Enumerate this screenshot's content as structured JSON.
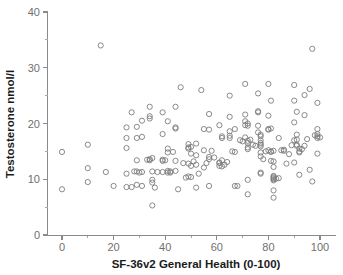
{
  "chart_data": {
    "type": "scatter",
    "title": "",
    "xlabel": "SF-36v2 General Health (0-100)",
    "ylabel": "Testosterone nmol/l",
    "xlim": [
      -6,
      107
    ],
    "ylim": [
      0,
      40
    ],
    "xticks": [
      0,
      20,
      40,
      60,
      80,
      100
    ],
    "xtick_labels": [
      "0",
      "20",
      "40",
      "60",
      "80",
      "100"
    ],
    "xminor_ticks": [
      10,
      30,
      50,
      70,
      90
    ],
    "yticks": [
      0,
      10,
      20,
      30,
      40
    ],
    "ytick_labels": [
      "0",
      "10",
      "20",
      "30",
      "40"
    ],
    "yminor_ticks": [
      5,
      15,
      25,
      35
    ],
    "grid": false,
    "legend": null,
    "marker": {
      "shape": "open-circle",
      "radius": 2.6,
      "stroke": "#7d7d7d",
      "fill": "none"
    },
    "series": [
      {
        "name": "participants",
        "n_points": 201,
        "points": [
          [
            0,
            14.9
          ],
          [
            0,
            8.2
          ],
          [
            10,
            16.2
          ],
          [
            10,
            12.0
          ],
          [
            10,
            9.5
          ],
          [
            15,
            34.0
          ],
          [
            17,
            11.3
          ],
          [
            20,
            8.8
          ],
          [
            25,
            15.6
          ],
          [
            25,
            17.4
          ],
          [
            25,
            19.3
          ],
          [
            25,
            11.0
          ],
          [
            25,
            8.6
          ],
          [
            27,
            22.0
          ],
          [
            27,
            8.6
          ],
          [
            29,
            17.4
          ],
          [
            29,
            19.4
          ],
          [
            29,
            13.4
          ],
          [
            29,
            11.4
          ],
          [
            29,
            9.0
          ],
          [
            31,
            20.5
          ],
          [
            31,
            17.6
          ],
          [
            31,
            11.3
          ],
          [
            31,
            8.8
          ],
          [
            34,
            23.0
          ],
          [
            34,
            21.3
          ],
          [
            34,
            20.9
          ],
          [
            34,
            13.6
          ],
          [
            34,
            13.4
          ],
          [
            35,
            13.8
          ],
          [
            35,
            11.4
          ],
          [
            35,
            9.9
          ],
          [
            35,
            9.4
          ],
          [
            35,
            5.3
          ],
          [
            36,
            8.5
          ],
          [
            39,
            22.0
          ],
          [
            39,
            18.1
          ],
          [
            39,
            13.5
          ],
          [
            39,
            13.3
          ],
          [
            39,
            11.3
          ],
          [
            41,
            20.4
          ],
          [
            41,
            15.5
          ],
          [
            41,
            14.8
          ],
          [
            41,
            11.5
          ],
          [
            41,
            11.2
          ],
          [
            42,
            11.4
          ],
          [
            42,
            11.2
          ],
          [
            44,
            23.0
          ],
          [
            44,
            19.3
          ],
          [
            44,
            19.1
          ],
          [
            44,
            13.3
          ],
          [
            44,
            11.5
          ],
          [
            45,
            8.2
          ],
          [
            46,
            26.5
          ],
          [
            49,
            16.3
          ],
          [
            49,
            15.7
          ],
          [
            49,
            15.5
          ],
          [
            49,
            12.8
          ],
          [
            49,
            10.5
          ],
          [
            50,
            15.8
          ],
          [
            50,
            14.6
          ],
          [
            50,
            12.4
          ],
          [
            50,
            10.4
          ],
          [
            52,
            16.4
          ],
          [
            52,
            14.3
          ],
          [
            52,
            12.6
          ],
          [
            52,
            8.5
          ],
          [
            54,
            26.0
          ],
          [
            55,
            19.0
          ],
          [
            55,
            15.2
          ],
          [
            55,
            12.1
          ],
          [
            57,
            21.7
          ],
          [
            57,
            18.9
          ],
          [
            57,
            14.0
          ],
          [
            57,
            13.6
          ],
          [
            57,
            8.8
          ],
          [
            61,
            19.7
          ],
          [
            61,
            13.0
          ],
          [
            61,
            12.9
          ],
          [
            61,
            12.4
          ],
          [
            62,
            17.7
          ],
          [
            62,
            17.4
          ],
          [
            62,
            13.4
          ],
          [
            62,
            12.3
          ],
          [
            65,
            25.0
          ],
          [
            65,
            21.2
          ],
          [
            65,
            18.6
          ],
          [
            65,
            17.8
          ],
          [
            65,
            17.4
          ],
          [
            67,
            19.0
          ],
          [
            67,
            14.9
          ],
          [
            67,
            8.8
          ],
          [
            71,
            27.1
          ],
          [
            71,
            21.6
          ],
          [
            71,
            20.4
          ],
          [
            71,
            19.7
          ],
          [
            71,
            17.5
          ],
          [
            72,
            20.0
          ],
          [
            72,
            19.6
          ],
          [
            72,
            16.9
          ],
          [
            72,
            16.5
          ],
          [
            72,
            15.7
          ],
          [
            72,
            15.4
          ],
          [
            72,
            9.9
          ],
          [
            72,
            7.3
          ],
          [
            76,
            25.4
          ],
          [
            76,
            22.2
          ],
          [
            76,
            22.0
          ],
          [
            76,
            19.6
          ],
          [
            76,
            18.4
          ],
          [
            77,
            18.0
          ],
          [
            77,
            17.7
          ],
          [
            77,
            17.0
          ],
          [
            77,
            16.5
          ],
          [
            77,
            16.2
          ],
          [
            77,
            15.9
          ],
          [
            77,
            14.8
          ],
          [
            77,
            14.1
          ],
          [
            77,
            11.2
          ],
          [
            77,
            11.0
          ],
          [
            80,
            27.1
          ],
          [
            80,
            21.4
          ],
          [
            80,
            19.0
          ],
          [
            80,
            18.9
          ],
          [
            80,
            15.2
          ],
          [
            81,
            24.1
          ],
          [
            81,
            19.1
          ],
          [
            81,
            15.0
          ],
          [
            81,
            14.9
          ],
          [
            81,
            13.3
          ],
          [
            82,
            15.1
          ],
          [
            82,
            13.2
          ],
          [
            82,
            12.2
          ],
          [
            82,
            10.6
          ],
          [
            82,
            10.4
          ],
          [
            82,
            10.2
          ],
          [
            82,
            10.0
          ],
          [
            82,
            9.8
          ],
          [
            82,
            8.0
          ],
          [
            82,
            6.7
          ],
          [
            84,
            17.4
          ],
          [
            84,
            10.2
          ],
          [
            86,
            15.3
          ],
          [
            86,
            15.1
          ],
          [
            90,
            26.9
          ],
          [
            90,
            24.1
          ],
          [
            90,
            20.2
          ],
          [
            90,
            17.0
          ],
          [
            90,
            13.0
          ],
          [
            91,
            22.1
          ],
          [
            91,
            18.0
          ],
          [
            91,
            17.1
          ],
          [
            91,
            16.2
          ],
          [
            91,
            16.0
          ],
          [
            92,
            15.5
          ],
          [
            92,
            15.0
          ],
          [
            92,
            14.8
          ],
          [
            92,
            10.8
          ],
          [
            94,
            25.1
          ],
          [
            94,
            21.5
          ],
          [
            94,
            16.0
          ],
          [
            96,
            26.2
          ],
          [
            96,
            11.7
          ],
          [
            97,
            33.4
          ],
          [
            97,
            9.6
          ],
          [
            99,
            23.7
          ],
          [
            99,
            19.0
          ],
          [
            99,
            18.1
          ],
          [
            99,
            17.7
          ],
          [
            99,
            17.4
          ],
          [
            99,
            14.6
          ],
          [
            30,
            11.2
          ],
          [
            33,
            13.5
          ],
          [
            37,
            11.3
          ],
          [
            43,
            14.9
          ],
          [
            47,
            12.9
          ],
          [
            51,
            13.2
          ],
          [
            53,
            11.0
          ],
          [
            56,
            12.9
          ],
          [
            59,
            13.9
          ],
          [
            63,
            12.6
          ],
          [
            66,
            15.0
          ],
          [
            69,
            17.0
          ],
          [
            73,
            17.1
          ],
          [
            74,
            16.2
          ],
          [
            75,
            16.0
          ],
          [
            78,
            13.6
          ],
          [
            79,
            15.0
          ],
          [
            83,
            10.1
          ],
          [
            85,
            15.2
          ],
          [
            88,
            14.5
          ],
          [
            89,
            16.1
          ],
          [
            93,
            15.4
          ],
          [
            95,
            17.2
          ],
          [
            98,
            17.9
          ],
          [
            100,
            17.5
          ],
          [
            40,
            13.4
          ],
          [
            48,
            10.3
          ],
          [
            58,
            15.1
          ],
          [
            64,
            13.1
          ],
          [
            68,
            8.8
          ],
          [
            70,
            16.8
          ],
          [
            87,
            12.8
          ],
          [
            28,
            11.4
          ]
        ]
      }
    ]
  },
  "axes": {
    "x_title": "SF-36v2 General Health (0-100)",
    "y_title": "Testosterone nmol/l"
  }
}
